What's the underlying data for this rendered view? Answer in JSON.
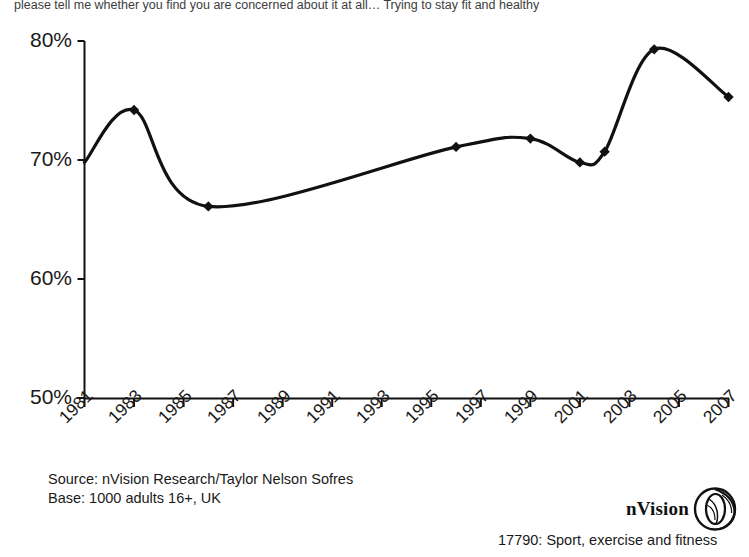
{
  "question_text": "please tell me whether you find you are concerned about it at all… Trying to stay fit and healthy",
  "source": {
    "line1": "Source: nVision Research/Taylor Nelson Sofres",
    "line2": "Base: 1000 adults 16+, UK"
  },
  "logo": {
    "text": "nVision",
    "mark": "nvision-eye-icon"
  },
  "caption": "17790: Sport, exercise and fitness",
  "chart_data": {
    "type": "line",
    "title": "",
    "subtitle": "please tell me whether you find you are concerned about it at all… Trying to stay fit and healthy",
    "xlabel": "",
    "ylabel": "",
    "xlim": [
      1981,
      2007
    ],
    "ylim": [
      50,
      80
    ],
    "ytick_labels": [
      "80%",
      "70%",
      "60%",
      "50%"
    ],
    "ytick_values": [
      80,
      70,
      60,
      50
    ],
    "xtick_labels": [
      "1981",
      "1983",
      "1985",
      "1987",
      "1989",
      "1991",
      "1993",
      "1995",
      "1997",
      "1999",
      "2001",
      "2003",
      "2005",
      "2007"
    ],
    "xtick_values": [
      1981,
      1983,
      1985,
      1987,
      1989,
      1991,
      1993,
      1995,
      1997,
      1999,
      2001,
      2003,
      2005,
      2007
    ],
    "grid": false,
    "legend": "none",
    "line_color": "#111111",
    "marker": "diamond",
    "smoothing": "spline",
    "series": [
      {
        "name": "Trying to stay fit and healthy",
        "points": [
          {
            "x": 1981,
            "y": 69.8,
            "marker": false
          },
          {
            "x": 1983,
            "y": 74.2,
            "marker": true
          },
          {
            "x": 1986,
            "y": 66.1,
            "marker": true
          },
          {
            "x": 1996,
            "y": 71.1,
            "marker": true
          },
          {
            "x": 1999,
            "y": 71.8,
            "marker": true
          },
          {
            "x": 2001,
            "y": 69.8,
            "marker": true
          },
          {
            "x": 2002,
            "y": 70.7,
            "marker": true
          },
          {
            "x": 2004,
            "y": 79.3,
            "marker": true
          },
          {
            "x": 2007,
            "y": 75.3,
            "marker": true
          }
        ]
      }
    ]
  }
}
